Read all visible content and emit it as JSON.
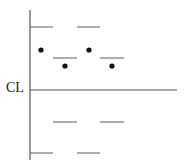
{
  "diagram": {
    "type": "control_chart_zones",
    "center_line_label": "CL",
    "axis": {
      "x": 30,
      "y_top": 10,
      "y_bottom": 160
    },
    "center_line": {
      "y": 90,
      "x_start": 30,
      "x_end": 177
    },
    "limit_dashes": [
      {
        "y": 27,
        "x1": 30,
        "x2": 53
      },
      {
        "y": 27,
        "x1": 77,
        "x2": 100
      },
      {
        "y": 58,
        "x1": 53,
        "x2": 77
      },
      {
        "y": 58,
        "x1": 100,
        "x2": 124
      },
      {
        "y": 122,
        "x1": 53,
        "x2": 77
      },
      {
        "y": 122,
        "x1": 100,
        "x2": 124
      },
      {
        "y": 153,
        "x1": 30,
        "x2": 53
      },
      {
        "y": 153,
        "x1": 77,
        "x2": 100
      }
    ],
    "points": [
      {
        "x": 41,
        "y": 50
      },
      {
        "x": 65,
        "y": 66
      },
      {
        "x": 89,
        "y": 50
      },
      {
        "x": 112,
        "y": 66
      }
    ],
    "colors": {
      "line": "#555555",
      "dash": "#777777",
      "point": "#111111"
    }
  }
}
